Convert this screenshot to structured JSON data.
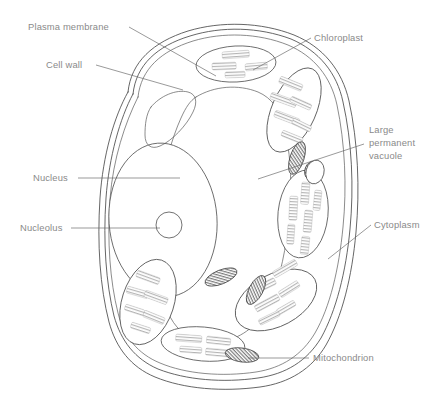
{
  "diagram": {
    "background_color": "#ffffff",
    "line_color": "#4a4a4a",
    "label_color": "#8a8a8a",
    "leader_color": "#6f6f6f"
  },
  "labels": [
    {
      "id": "plasma-membrane",
      "text": "Plasma membrane",
      "x": 28,
      "y": 30,
      "anchor": "start"
    },
    {
      "id": "cell-wall",
      "text": "Cell wall",
      "x": 46,
      "y": 68,
      "anchor": "start"
    },
    {
      "id": "nucleus",
      "text": "Nucleus",
      "x": 33,
      "y": 181,
      "anchor": "start"
    },
    {
      "id": "nucleolus",
      "text": "Nucleolus",
      "x": 20,
      "y": 231,
      "anchor": "start"
    },
    {
      "id": "chloroplast",
      "text": "Chloroplast",
      "x": 314,
      "y": 41,
      "anchor": "start"
    },
    {
      "id": "cytoplasm",
      "text": "Cytoplasm",
      "x": 374,
      "y": 228,
      "anchor": "start"
    },
    {
      "id": "mitochondrion",
      "text": "Mitochondrion",
      "x": 313,
      "y": 361,
      "anchor": "start"
    }
  ],
  "multiline_labels": [
    {
      "id": "large-permanent-vacuole",
      "lines": [
        "Large",
        "permanent",
        "vacuole"
      ],
      "x": 369,
      "y": 133,
      "line_height": 13
    }
  ],
  "organelles": [
    {
      "name": "cell-wall",
      "count": 1,
      "description": "outer double-line boundary"
    },
    {
      "name": "plasma-membrane",
      "count": 1,
      "description": "inner line just inside cell wall"
    },
    {
      "name": "nucleus",
      "count": 1,
      "description": "large oval, left of centre"
    },
    {
      "name": "nucleolus",
      "count": 1,
      "description": "small circle inside nucleus"
    },
    {
      "name": "large-permanent-vacuole",
      "count": 1,
      "description": "central region"
    },
    {
      "name": "chloroplast",
      "count": 6,
      "description": "ovals containing grana stacks"
    },
    {
      "name": "mitochondrion",
      "count": 5,
      "description": "small dark hatched ellipses"
    },
    {
      "name": "cytoplasm",
      "count": 1,
      "description": "region between organelles"
    }
  ]
}
